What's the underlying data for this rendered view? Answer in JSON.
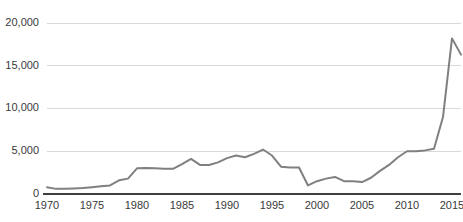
{
  "chart_data": {
    "type": "line",
    "title": "",
    "subtitle": "",
    "xlabel": "",
    "ylabel": "",
    "xlim": [
      1970,
      2016
    ],
    "ylim": [
      0,
      20000
    ],
    "grid": true,
    "legend": null,
    "legend_position": "none",
    "line_color": "#808080",
    "gridline_color": "#d9d9d9",
    "axis_color": "#3f3f3f",
    "background_color": "#ffffff",
    "ytick_labels": [
      "20,000",
      "15,000",
      "10,000",
      "5,000",
      "0"
    ],
    "ytick_values": [
      20000,
      15000,
      10000,
      5000,
      0
    ],
    "xtick_labels": [
      "1970",
      "1975",
      "1980",
      "1985",
      "1990",
      "1995",
      "2000",
      "2005",
      "2010",
      "2015"
    ],
    "xtick_values": [
      1970,
      1975,
      1980,
      1985,
      1990,
      1995,
      2000,
      2005,
      2010,
      2015
    ],
    "x": [
      1970,
      1971,
      1972,
      1973,
      1974,
      1975,
      1976,
      1977,
      1978,
      1979,
      1980,
      1981,
      1982,
      1983,
      1984,
      1985,
      1986,
      1987,
      1988,
      1989,
      1990,
      1991,
      1992,
      1993,
      1994,
      1995,
      1996,
      1997,
      1998,
      1999,
      2000,
      2001,
      2002,
      2003,
      2004,
      2005,
      2006,
      2007,
      2008,
      2009,
      2010,
      2011,
      2012,
      2013,
      2014,
      2015,
      2016
    ],
    "values": [
      800,
      600,
      600,
      650,
      700,
      800,
      900,
      1000,
      1600,
      1800,
      3000,
      3050,
      3000,
      2950,
      2950,
      3500,
      4100,
      3400,
      3400,
      3700,
      4200,
      4500,
      4300,
      4700,
      5200,
      4500,
      3200,
      3100,
      3100,
      1000,
      1500,
      1800,
      2000,
      1500,
      1500,
      1400,
      1900,
      2700,
      3400,
      4300,
      5000,
      5000,
      5100,
      5300,
      9000,
      18200,
      16300
    ],
    "series": [
      {
        "name": "series-1",
        "values": [
          800,
          600,
          600,
          650,
          700,
          800,
          900,
          1000,
          1600,
          1800,
          3000,
          3050,
          3000,
          2950,
          2950,
          3500,
          4100,
          3400,
          3400,
          3700,
          4200,
          4500,
          4300,
          4700,
          5200,
          4500,
          3200,
          3100,
          3100,
          1000,
          1500,
          1800,
          2000,
          1500,
          1500,
          1400,
          1900,
          2700,
          3400,
          4300,
          5000,
          5000,
          5100,
          5300,
          9000,
          18200,
          16300
        ]
      }
    ]
  }
}
